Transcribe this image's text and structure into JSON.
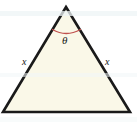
{
  "figure": {
    "kind": "geometry-diagram",
    "canvas": {
      "width": 137,
      "height": 122,
      "background_color": "#FFFFFF"
    },
    "shape": {
      "name": "isosceles-triangle",
      "fill_color": "#FAF8E8",
      "stroke_color": "#1A1A1A",
      "stroke_width": 2.6,
      "vertices": [
        {
          "name": "apex",
          "x": 66,
          "y": 7
        },
        {
          "name": "bottom-right",
          "x": 130,
          "y": 112
        },
        {
          "name": "bottom-left",
          "x": 3,
          "y": 112
        }
      ],
      "points_path": "66,7 130,112 3,112"
    },
    "angle_arc": {
      "name": "apex-angle-arc",
      "stroke_color": "#C0504D",
      "stroke_width": 1.4,
      "path": "M 52.5 29.5 Q 66 37.5 80.5 29.5"
    },
    "labels": {
      "apex_angle": "θ",
      "left_side": "x",
      "right_side": "x"
    }
  }
}
